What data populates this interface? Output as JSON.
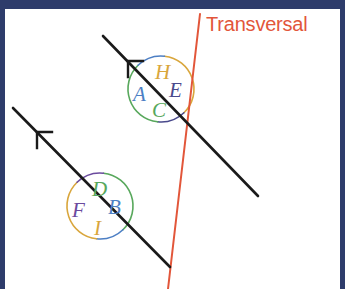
{
  "figure": {
    "title_label": "Transversal",
    "colors": {
      "frame": "#2e3c6b",
      "background": "#ffffff",
      "parallel_line": "#1a1a1a",
      "transversal": "#e2563a",
      "label_blue": "#4d7fc4",
      "label_navy": "#4a4a8c",
      "label_green": "#58a85c",
      "label_gold": "#d9a63c",
      "label_purple": "#6b4b9e"
    },
    "transversal": {
      "label": "Transversal",
      "color": "#e2563a",
      "x1": 200,
      "y1": 14,
      "x2": 168,
      "y2": 289
    },
    "parallel_lines": [
      {
        "name": "upper-parallel-line",
        "x1": 103,
        "y1": 36,
        "x2": 258,
        "y2": 196,
        "arrow": {
          "x": 128,
          "y": 61,
          "direction": "up-left"
        }
      },
      {
        "name": "lower-parallel-line",
        "x1": 13,
        "y1": 108,
        "x2": 170,
        "y2": 267,
        "arrow": {
          "x": 37,
          "y": 132,
          "direction": "up-left"
        }
      }
    ],
    "upper_intersection": {
      "name": "upper-angle-cluster",
      "center_x": 161,
      "center_y": 89,
      "radius": 33,
      "angles": [
        {
          "id": "H",
          "label": "H",
          "position": "top",
          "color": "#d9a63c",
          "x": 155,
          "y": 62
        },
        {
          "id": "A",
          "label": "A",
          "position": "left",
          "color": "#4d7fc4",
          "x": 133,
          "y": 84
        },
        {
          "id": "E",
          "label": "E",
          "position": "right",
          "color": "#4a4a8c",
          "x": 169,
          "y": 80
        },
        {
          "id": "C",
          "label": "C",
          "position": "bottom",
          "color": "#58a85c",
          "x": 152,
          "y": 100
        }
      ],
      "arcs": [
        {
          "position": "top",
          "color": "#d9a63c"
        },
        {
          "position": "left",
          "color": "#4d7fc4"
        },
        {
          "position": "right",
          "color": "#4a4a8c"
        },
        {
          "position": "bottom",
          "color": "#58a85c"
        }
      ]
    },
    "lower_intersection": {
      "name": "lower-angle-cluster",
      "center_x": 100,
      "center_y": 206,
      "radius": 33,
      "angles": [
        {
          "id": "D",
          "label": "D",
          "position": "top",
          "color": "#58a85c",
          "x": 92,
          "y": 179
        },
        {
          "id": "F",
          "label": "F",
          "position": "left",
          "color": "#6b4b9e",
          "x": 72,
          "y": 200
        },
        {
          "id": "B",
          "label": "B",
          "position": "right",
          "color": "#4d7fc4",
          "x": 108,
          "y": 197
        },
        {
          "id": "I",
          "label": "I",
          "position": "bottom",
          "color": "#d9a63c",
          "x": 94,
          "y": 218
        }
      ],
      "arcs": [
        {
          "position": "top",
          "color": "#58a85c"
        },
        {
          "position": "left",
          "color": "#6b4b9e"
        },
        {
          "position": "right",
          "color": "#4d7fc4"
        },
        {
          "position": "bottom",
          "color": "#d9a63c"
        }
      ]
    }
  }
}
